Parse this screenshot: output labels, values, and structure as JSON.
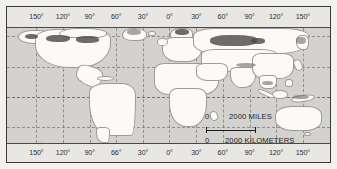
{
  "map": {
    "title": "World map with graticule",
    "projection": "cylindrical",
    "ocean_color": "#d4d2cf",
    "land_color": "#fbfaf8",
    "frame_color": "#3a3a3a",
    "graticule_color": "#5a5a5a",
    "longitude_labels_top": [
      "150°",
      "120°",
      "90°",
      "60°",
      "30°",
      "0°",
      "30°",
      "60°",
      "90°",
      "120°",
      "150°"
    ],
    "longitude_labels_bottom": [
      "150°",
      "120°",
      "90°",
      "66°",
      "30°",
      "0°",
      "30°",
      "60°",
      "90°",
      "120°",
      "150°"
    ],
    "latitude_labels_left": [
      "60°",
      "30°",
      "0°",
      "30°"
    ],
    "latitude_labels_right": [
      "60°",
      "30°",
      "0°",
      "30°"
    ]
  },
  "scale": {
    "miles_zero": "0",
    "miles_text": "2000 MILES",
    "km_zero": "0",
    "km_text": "2000 KILOMETERS"
  }
}
